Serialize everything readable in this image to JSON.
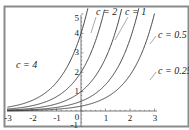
{
  "chart_data": {
    "type": "line",
    "title": "",
    "xlabel": "",
    "ylabel": "",
    "function": "y = c * e^x",
    "xlim": [
      -3,
      3
    ],
    "ylim": [
      -1,
      5
    ],
    "grid": false,
    "legend": "inline labels",
    "x_ticks": [
      -3,
      -2,
      -1,
      0,
      1,
      2,
      3
    ],
    "y_ticks": [
      -1,
      0,
      1,
      2,
      3,
      4,
      5
    ],
    "series": [
      {
        "name": "c = 4",
        "c": 4,
        "label_text": "c = 4"
      },
      {
        "name": "c = 2",
        "c": 2,
        "label_text": "c = 2"
      },
      {
        "name": "c = 1",
        "c": 1,
        "label_text": "c = 1"
      },
      {
        "name": "c = 0.5",
        "c": 0.5,
        "label_text": "c = 0.5"
      },
      {
        "name": "c = 0.25",
        "c": 0.25,
        "label_text": "c = 0.25"
      }
    ],
    "sample_points": {
      "x": [
        -3,
        -2,
        -1,
        0,
        1,
        1.5
      ],
      "c=4": [
        0.2,
        0.54,
        1.47,
        4.0,
        null,
        null
      ],
      "c=2": [
        0.1,
        0.27,
        0.74,
        2.0,
        null,
        null
      ],
      "c=1": [
        0.05,
        0.14,
        0.37,
        1.0,
        2.72,
        4.48
      ],
      "c=0.5": [
        0.02,
        0.07,
        0.18,
        0.5,
        1.36,
        2.24
      ],
      "c=0.25": [
        0.01,
        0.03,
        0.09,
        0.25,
        0.68,
        1.12
      ]
    }
  },
  "labels": {
    "c4": "c = 4",
    "c2": "c = 2",
    "c1": "c = 1",
    "c05": "c = 0.5",
    "c025": "c = 0.25"
  },
  "axis": {
    "x": {
      "m3": "-3",
      "m2": "-2",
      "m1": "-1",
      "z": "0",
      "p1": "1",
      "p2": "2",
      "p3": "3"
    },
    "y": {
      "m1": "-1",
      "p1": "1",
      "p2": "2",
      "p3": "3",
      "p4": "4",
      "p5": "5"
    }
  },
  "colors": {
    "frame": "#8a8a8a",
    "curve": "#333333",
    "axis": "#555555"
  }
}
